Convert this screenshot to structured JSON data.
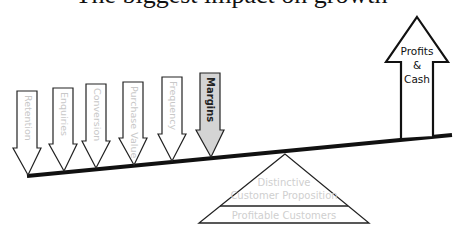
{
  "caption": {
    "text": "The biggest impact on growth",
    "note": "partially cropped at top edge"
  },
  "lever_arrows": [
    {
      "label": "Retention",
      "highlighted": false,
      "shaft_x": 17,
      "top_y": 91,
      "tip_x": 28,
      "tip_y": 175
    },
    {
      "label": "Enquiries",
      "highlighted": false,
      "shaft_x": 53,
      "top_y": 88,
      "tip_x": 64,
      "tip_y": 171
    },
    {
      "label": "Conversion",
      "highlighted": false,
      "shaft_x": 86,
      "top_y": 84,
      "tip_x": 96,
      "tip_y": 168
    },
    {
      "label": "Purchase Value",
      "highlighted": false,
      "shaft_x": 123,
      "top_y": 82,
      "tip_x": 134,
      "tip_y": 165
    },
    {
      "label": "Frequency",
      "highlighted": false,
      "shaft_x": 162,
      "top_y": 77,
      "tip_x": 172,
      "tip_y": 161
    },
    {
      "label": "Margins",
      "highlighted": true,
      "shaft_x": 200,
      "top_y": 73,
      "tip_x": 211,
      "tip_y": 157
    }
  ],
  "result_arrow": {
    "lines": [
      "Profits",
      "&",
      "Cash"
    ]
  },
  "fulcrum": {
    "top_label_lines": [
      "Distinctive",
      "Customer Proposition"
    ],
    "bottom_label": "Profitable Customers"
  },
  "colors": {
    "stroke": "#111111",
    "faint_label": "#c8c8c8",
    "highlight_fill": "#d4d4d4",
    "highlight_text": "#222222"
  }
}
